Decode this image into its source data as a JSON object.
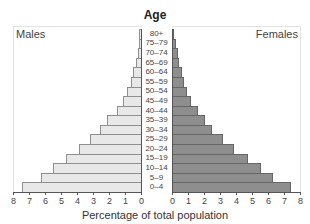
{
  "chart_data": {
    "type": "bar",
    "subtype": "population-pyramid",
    "title": "Age",
    "xlabel": "Percentage of total population",
    "ylabel": "Age",
    "categories": [
      "80+",
      "75–79",
      "70–74",
      "65–69",
      "60–64",
      "55–59",
      "50–54",
      "45–49",
      "40–44",
      "35–39",
      "30–34",
      "25–29",
      "20–24",
      "15–19",
      "10–14",
      "5–9",
      "0–4"
    ],
    "series": [
      {
        "name": "Males",
        "side": "left",
        "color": "#e8e8e8",
        "values": [
          0.1,
          0.15,
          0.2,
          0.3,
          0.5,
          0.65,
          0.85,
          1.1,
          1.5,
          2.1,
          2.55,
          3.2,
          3.9,
          4.7,
          5.5,
          6.25,
          7.45
        ]
      },
      {
        "name": "Females",
        "side": "right",
        "color": "#8e8e8e",
        "values": [
          0.15,
          0.25,
          0.35,
          0.45,
          0.6,
          0.75,
          0.95,
          1.2,
          1.6,
          2.05,
          2.5,
          3.2,
          3.9,
          4.75,
          5.55,
          6.3,
          7.45
        ]
      }
    ],
    "xlim": [
      0,
      8
    ],
    "x_ticks_left": [
      "8",
      "7",
      "6",
      "5",
      "4",
      "3",
      "2",
      "1",
      "0"
    ],
    "x_ticks_right": [
      "0",
      "1",
      "2",
      "3",
      "4",
      "5",
      "6",
      "7",
      "8"
    ],
    "grid": false,
    "legend": {
      "left_label": "Males",
      "right_label": "Females",
      "position": "top-corners"
    }
  },
  "labels": {
    "title": "Age",
    "males": "Males",
    "females": "Females",
    "xlabel": "Percentage of total population"
  }
}
